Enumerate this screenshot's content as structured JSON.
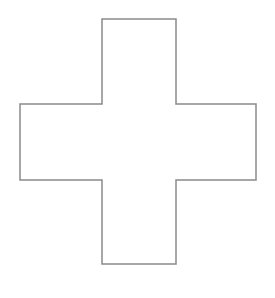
{
  "figure": {
    "background_color": "#ffffff",
    "canvas_width": 275,
    "canvas_height": 298
  },
  "shape": {
    "name": "cross-outline",
    "kind": "polygon",
    "label": "plus-shape",
    "stroke_color": "#8a8a8a",
    "fill_color": "none",
    "stroke_width": 1.5,
    "vertex_count": 12,
    "bounds": {
      "left": 20,
      "top": 19,
      "right": 256,
      "bottom": 264,
      "width": 236,
      "height": 245
    },
    "arms": {
      "vertical_bar_left": 102,
      "vertical_bar_right": 176,
      "vertical_bar_top": 19,
      "vertical_bar_bottom": 264,
      "horizontal_bar_top": 104,
      "horizontal_bar_bottom": 180,
      "horizontal_bar_left": 20,
      "horizontal_bar_right": 256
    },
    "points": "102,19 176,19 176,104 256,104 256,180 176,180 176,264 102,264 102,180 20,180 20,104 102,104"
  }
}
